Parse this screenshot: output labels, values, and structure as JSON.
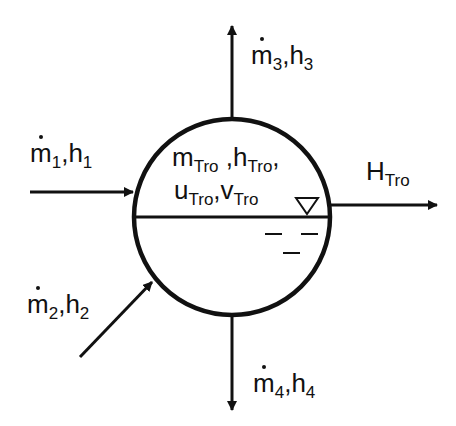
{
  "diagram": {
    "type": "control-volume-energy-balance",
    "stroke_color": "#111111",
    "background": "#ffffff",
    "vessel": {
      "shape": "circle",
      "liquid_level_symbol": "inverted-triangle",
      "state_labels": {
        "line1": {
          "m": "m",
          "m_sub": "Tro",
          "sep1": " ,",
          "h": "h",
          "h_sub": "Tro",
          "sep2": ","
        },
        "line2": {
          "u": "u",
          "u_sub": "Tro",
          "sep": ",",
          "v": "v",
          "v_sub": "Tro"
        }
      }
    },
    "streams": [
      {
        "id": "stream-1",
        "direction": "in",
        "position": "left",
        "m": "m",
        "m_sub": "1",
        "sep": ",",
        "h": "h",
        "h_sub": "1"
      },
      {
        "id": "stream-2",
        "direction": "in",
        "position": "lower-left",
        "m": "m",
        "m_sub": "2",
        "sep": ",",
        "h": "h",
        "h_sub": "2"
      },
      {
        "id": "stream-3",
        "direction": "out",
        "position": "top",
        "m": "m",
        "m_sub": "3",
        "sep": ",",
        "h": "h",
        "h_sub": "3"
      },
      {
        "id": "stream-4",
        "direction": "out",
        "position": "bottom",
        "m": "m",
        "m_sub": "4",
        "sep": ",",
        "h": "h",
        "h_sub": "4"
      }
    ],
    "enthalpy_output": {
      "label": "H",
      "sub": "Tro",
      "direction": "out",
      "position": "right"
    }
  }
}
